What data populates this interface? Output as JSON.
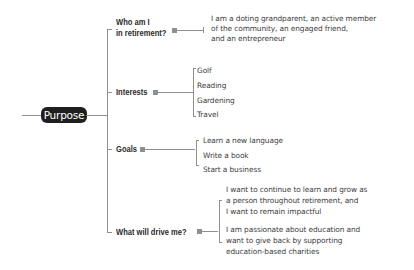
{
  "root": {
    "label": "Purpose",
    "colors": {
      "pill_bg": "#1f1f1f",
      "pill_text": "#ffffff",
      "connector": "#8f8f8f"
    }
  },
  "branches": [
    {
      "label_line1": "Who am I",
      "label_line2": "in retirement?",
      "items": [
        "I am a doting grandparent, an active member",
        "of the community, an engaged friend,",
        "and an entrepreneur"
      ]
    },
    {
      "label": "Interests",
      "items": [
        "Golf",
        "Reading",
        "Gardening",
        "Travel"
      ]
    },
    {
      "label": "Goals",
      "items": [
        "Learn a new language",
        "Write a book",
        "Start a business"
      ]
    },
    {
      "label": "What will drive me?",
      "items": [
        "I want to continue to learn and grow as",
        "a person throughout retirement, and",
        "I want to remain impactful",
        "I am passionate about education and",
        "want to give back by supporting",
        "education-based charities"
      ]
    }
  ]
}
